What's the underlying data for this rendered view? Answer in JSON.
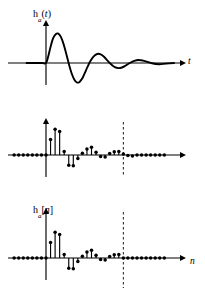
{
  "figure": {
    "background_color": "#ffffff",
    "ink_color": "#000000",
    "width": 205,
    "height": 298
  },
  "panels": [
    {
      "id": "continuous",
      "signal_label": {
        "name": "h",
        "subscript": "a",
        "open": "(",
        "arg": "t",
        "close": ")"
      },
      "x_axis_label": "t",
      "y_axis_label": "",
      "marker_label": ""
    },
    {
      "id": "sampled",
      "signal_label": {
        "name": "h",
        "subscript": "a",
        "open": "[",
        "arg": "n",
        "close": "]"
      },
      "x_axis_label": "n",
      "y_axis_label": "",
      "marker_label": ""
    },
    {
      "id": "truncated",
      "signal_label": {
        "name": "h",
        "subscript": "N",
        "open": "[",
        "arg": "n",
        "close": "]"
      },
      "x_axis_label": "n",
      "y_axis_label": "",
      "marker_label": "N"
    }
  ],
  "chart_data": [
    {
      "type": "line",
      "id": "continuous-impulse-response",
      "title": "h_a(t)",
      "xlabel": "t",
      "ylabel": "h_a(t)",
      "grid": false,
      "legend": false,
      "xlim": [
        -2.2,
        14.5
      ],
      "ylim": [
        -1.15,
        1.15
      ],
      "annotations": [
        "axis arrow on t",
        "axis arrow on h_a(t)"
      ],
      "x": [
        -2.2,
        -1.2,
        -0.4,
        0.0,
        0.25,
        0.5,
        0.8,
        1.1,
        1.4,
        1.7,
        2.0,
        2.3,
        2.6,
        2.9,
        3.2,
        3.5,
        3.8,
        4.1,
        4.4,
        4.7,
        5.0,
        5.4,
        5.8,
        6.2,
        6.6,
        7.0,
        7.4,
        7.8,
        8.2,
        8.6,
        9.0,
        9.5,
        10.0,
        10.5,
        11.0,
        11.5,
        12.0,
        12.8,
        13.6,
        14.5
      ],
      "y": [
        0.0,
        0.0,
        0.0,
        0.0,
        0.22,
        0.52,
        0.82,
        0.96,
        0.98,
        0.86,
        0.62,
        0.3,
        -0.04,
        -0.34,
        -0.55,
        -0.65,
        -0.63,
        -0.52,
        -0.33,
        -0.13,
        0.05,
        0.22,
        0.3,
        0.29,
        0.2,
        0.07,
        -0.05,
        -0.14,
        -0.17,
        -0.15,
        -0.09,
        0.0,
        0.07,
        0.1,
        0.08,
        0.04,
        -0.01,
        -0.04,
        -0.02,
        0.0
      ]
    },
    {
      "type": "stem",
      "id": "sampled-impulse-response",
      "title": "h_a[n]",
      "xlabel": "n",
      "ylabel": "h_a[n]",
      "grid": false,
      "legend": false,
      "xlim": [
        -7,
        27
      ],
      "ylim": [
        -0.62,
        1.05
      ],
      "annotations": [
        "vertical dashed marker (unlabeled) near n = 17"
      ],
      "marker_n": 17,
      "n": [
        -7,
        -6,
        -5,
        -4,
        -3,
        -2,
        -1,
        0,
        1,
        2,
        3,
        4,
        5,
        6,
        7,
        8,
        9,
        10,
        11,
        12,
        13,
        14,
        15,
        16,
        17,
        18,
        19,
        20,
        21,
        22,
        23,
        24,
        25,
        26
      ],
      "values": [
        0.0,
        0.0,
        0.0,
        0.0,
        0.0,
        0.0,
        0.0,
        0.0,
        0.52,
        0.86,
        0.78,
        0.12,
        -0.34,
        -0.36,
        -0.12,
        0.06,
        0.2,
        0.26,
        0.09,
        -0.05,
        -0.07,
        0.05,
        0.11,
        0.12,
        0.03,
        -0.02,
        -0.03,
        0.0,
        0.0,
        0.0,
        0.0,
        0.0,
        0.0,
        0.0
      ]
    },
    {
      "type": "stem",
      "id": "truncated-impulse-response",
      "title": "h_N[n]",
      "xlabel": "n",
      "ylabel": "h_N[n]",
      "grid": false,
      "legend": false,
      "xlim": [
        -7,
        27
      ],
      "ylim": [
        -0.62,
        1.05
      ],
      "annotations": [
        "vertical dashed marker labeled N at n = 17"
      ],
      "marker_n": 17,
      "marker_label": "N",
      "n": [
        -7,
        -6,
        -5,
        -4,
        -3,
        -2,
        -1,
        0,
        1,
        2,
        3,
        4,
        5,
        6,
        7,
        8,
        9,
        10,
        11,
        12,
        13,
        14,
        15,
        16,
        17,
        18,
        19,
        20,
        21,
        22,
        23,
        24,
        25,
        26
      ],
      "values": [
        0.0,
        0.0,
        0.0,
        0.0,
        0.0,
        0.0,
        0.0,
        0.0,
        0.52,
        0.86,
        0.78,
        0.12,
        -0.34,
        -0.36,
        -0.12,
        0.06,
        0.2,
        0.26,
        0.09,
        -0.05,
        -0.07,
        0.05,
        0.11,
        0.12,
        0.0,
        0.0,
        0.0,
        0.0,
        0.0,
        0.0,
        0.0,
        0.0,
        0.0,
        0.0
      ]
    }
  ]
}
